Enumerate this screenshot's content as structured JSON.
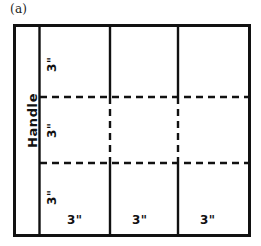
{
  "figure": {
    "label": "(a)",
    "type": "sheet-metal-layout-diagram"
  },
  "annotations": {
    "handle_label": "Handle",
    "vertical_marks": [
      {
        "id": "row-1-height",
        "text": "3\""
      },
      {
        "id": "row-2-height",
        "text": "3\""
      },
      {
        "id": "row-3-height",
        "text": "3\""
      }
    ],
    "horizontal_marks": [
      {
        "id": "col-1-width",
        "text": "3\""
      },
      {
        "id": "col-2-width",
        "text": "3\""
      },
      {
        "id": "col-3-width",
        "text": "3\""
      }
    ]
  },
  "geometry": {
    "outline": {
      "x": 13,
      "y": 24,
      "width": 238,
      "height": 213
    },
    "handle_strip": {
      "x": 13,
      "y": 24,
      "width": 26,
      "height": 213
    },
    "grid": {
      "x": 39,
      "y": 24,
      "width": 212,
      "height": 213
    },
    "vertical_solid_lines_x": [
      110,
      178
    ],
    "horizontal_dashed_lines_y": [
      97,
      163
    ],
    "rows": 3,
    "columns": 3
  },
  "colors": {
    "ink": "#111111",
    "paper": "#ffffff",
    "caption": "#1a1a1a"
  },
  "strokes": {
    "outline_width": 3,
    "interior_width": 2.4,
    "dash_pattern": "7 5"
  }
}
